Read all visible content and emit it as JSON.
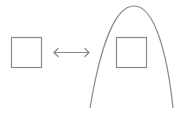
{
  "diagram": {
    "stroke_color": "#8a8a8a",
    "background": "#ffffff",
    "elements": [
      {
        "id": "left-square",
        "shape": "square"
      },
      {
        "id": "double-arrow",
        "shape": "double-headed-arrow"
      },
      {
        "id": "arch",
        "shape": "parabolic-arch"
      },
      {
        "id": "right-square",
        "shape": "square",
        "enclosed_by": "arch"
      }
    ]
  }
}
